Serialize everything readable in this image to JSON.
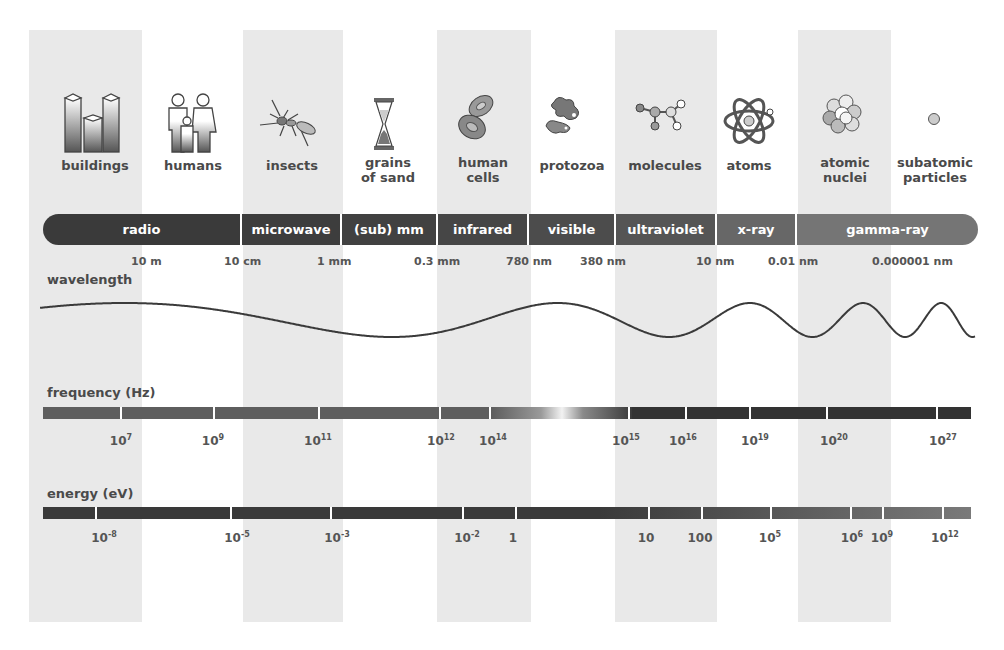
{
  "objects": [
    {
      "label": "buildings",
      "icon": "buildings-icon"
    },
    {
      "label": "humans",
      "icon": "humans-icon"
    },
    {
      "label": "insects",
      "icon": "insect-icon"
    },
    {
      "label": "grains\nof sand",
      "line1": "grains",
      "line2": "of sand",
      "icon": "hourglass-icon"
    },
    {
      "label": "human\ncells",
      "line1": "human",
      "line2": "cells",
      "icon": "cells-icon"
    },
    {
      "label": "protozoa",
      "icon": "protozoa-icon"
    },
    {
      "label": "molecules",
      "icon": "molecule-icon"
    },
    {
      "label": "atoms",
      "icon": "atom-icon"
    },
    {
      "label": "atomic\nnuclei",
      "line1": "atomic",
      "line2": "nuclei",
      "icon": "nucleus-icon"
    },
    {
      "label": "subatomic\nparticles",
      "line1": "subatomic",
      "line2": "particles",
      "icon": "particle-icon"
    }
  ],
  "bands": [
    {
      "label": "radio",
      "color": "#3a3a3a"
    },
    {
      "label": "microwave",
      "color": "#3d3d3d"
    },
    {
      "label": "(sub) mm",
      "color": "#414141"
    },
    {
      "label": "infrared",
      "color": "#464646"
    },
    {
      "label": "visible",
      "color": "#4c4c4c"
    },
    {
      "label": "ultraviolet",
      "color": "#555555"
    },
    {
      "label": "x-ray",
      "color": "#676767"
    },
    {
      "label": "gamma-ray",
      "color": "#757575"
    }
  ],
  "wavelength": {
    "title": "wavelength",
    "ticks": [
      "10 m",
      "10 cm",
      "1 mm",
      "0.3 mm",
      "780 nm",
      "380 nm",
      "10 nm",
      "0.01 nm",
      "0.000001 nm"
    ]
  },
  "frequency": {
    "title": "frequency (Hz)",
    "ticks": [
      {
        "base": "10",
        "exp": "7"
      },
      {
        "base": "10",
        "exp": "9"
      },
      {
        "base": "10",
        "exp": "11"
      },
      {
        "base": "10",
        "exp": "12"
      },
      {
        "base": "10",
        "exp": "14"
      },
      {
        "base": "10",
        "exp": "15"
      },
      {
        "base": "10",
        "exp": "16"
      },
      {
        "base": "10",
        "exp": "19"
      },
      {
        "base": "10",
        "exp": "20"
      },
      {
        "base": "10",
        "exp": "27"
      }
    ]
  },
  "energy": {
    "title": "energy (eV)",
    "ticks": [
      {
        "base": "10",
        "exp": "-8"
      },
      {
        "base": "10",
        "exp": "-5"
      },
      {
        "base": "10",
        "exp": "-3"
      },
      {
        "base": "10",
        "exp": "-2"
      },
      {
        "base": "1",
        "exp": ""
      },
      {
        "base": "10",
        "exp": ""
      },
      {
        "base": "100",
        "exp": ""
      },
      {
        "base": "10",
        "exp": "5"
      },
      {
        "base": "10",
        "exp": "6"
      },
      {
        "base": "10",
        "exp": "9"
      },
      {
        "base": "10",
        "exp": "12"
      }
    ]
  },
  "colors": {
    "column_shade": "#e9e9e9",
    "text": "#4a4a4a",
    "bar_dark": "#3a3a3a",
    "bar_light": "#7a7a7a"
  }
}
